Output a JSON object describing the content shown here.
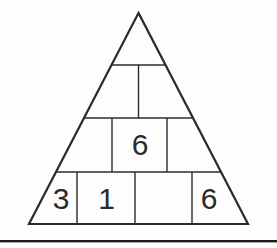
{
  "figure": {
    "name": "number-pyramid-puzzle",
    "rows": [
      {
        "cells": [
          ""
        ]
      },
      {
        "cells": [
          "",
          ""
        ]
      },
      {
        "cells": [
          "",
          "6",
          ""
        ]
      },
      {
        "cells": [
          "3",
          "1",
          "",
          "6"
        ]
      }
    ]
  },
  "colors": {
    "line": "#2b2b2b",
    "text": "#2a2a2a",
    "rule": "#1c1c1c",
    "background": "#fdfdfd"
  }
}
